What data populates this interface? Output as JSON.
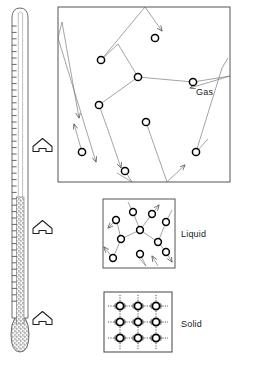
{
  "figure": {
    "background_color": "#ffffff",
    "line_color": "#3a3a3a",
    "particle_outline_color": "#000000",
    "label_color": "#1a1a1a"
  },
  "thermometer": {
    "name": "thermometer",
    "tube": {
      "x": 12,
      "y": 8,
      "width": 16,
      "height": 345
    },
    "stem_top_y": 10,
    "bulb": {
      "cx": 20,
      "cy": 340,
      "rx": 9,
      "ry": 16
    },
    "fill_top_y": 197,
    "fill_color": "#8c8c8c",
    "fill_texture": "stipple",
    "tick_count": 46,
    "tick_spacing": 6.4,
    "tick_side": "left",
    "outline_color": "#4a4a4a"
  },
  "heat_arrows": [
    {
      "name": "heat-arrow-gas",
      "x": 33,
      "y": 145,
      "points_to": "gas"
    },
    {
      "name": "heat-arrow-liquid",
      "x": 33,
      "y": 227,
      "points_to": "liquid"
    },
    {
      "name": "heat-arrow-solid",
      "x": 33,
      "y": 318,
      "points_to": "solid"
    }
  ],
  "states": [
    {
      "id": "gas",
      "label": "Gas",
      "label_x": 196,
      "label_y": 95,
      "box": {
        "x": 58,
        "y": 7,
        "width": 172,
        "height": 175
      },
      "description": "Widely separated particles travelling long straight paths, colliding with walls and each other",
      "particle_radius": 3.6,
      "particles": [
        {
          "cx": 155,
          "cy": 38
        },
        {
          "cx": 101,
          "cy": 60
        },
        {
          "cx": 138,
          "cy": 77
        },
        {
          "cx": 193,
          "cy": 82
        },
        {
          "cx": 99,
          "cy": 105
        },
        {
          "cx": 146,
          "cy": 122
        },
        {
          "cx": 82,
          "cy": 152
        },
        {
          "cx": 125,
          "cy": 171
        },
        {
          "cx": 196,
          "cy": 152
        }
      ]
    },
    {
      "id": "liquid",
      "label": "Liquid",
      "label_x": 181,
      "label_y": 237,
      "box": {
        "x": 103,
        "y": 199,
        "width": 72,
        "height": 69
      },
      "description": "Particles close together but free to slide past one another on short irregular paths",
      "particle_radius": 3.4,
      "particles": [
        {
          "cx": 116,
          "cy": 220
        },
        {
          "cx": 133,
          "cy": 212
        },
        {
          "cx": 152,
          "cy": 214
        },
        {
          "cx": 166,
          "cy": 222
        },
        {
          "cx": 140,
          "cy": 230
        },
        {
          "cx": 121,
          "cy": 239
        },
        {
          "cx": 158,
          "cy": 242
        },
        {
          "cx": 113,
          "cy": 258
        },
        {
          "cx": 140,
          "cy": 254
        },
        {
          "cx": 166,
          "cy": 252
        }
      ]
    },
    {
      "id": "solid",
      "label": "Solid",
      "label_x": 181,
      "label_y": 327,
      "box": {
        "x": 104,
        "y": 292,
        "width": 68,
        "height": 60
      },
      "description": "Particles locked in a regular lattice, vibrating about fixed positions",
      "particle_radius": 3.6,
      "lattice_columns": 3,
      "lattice_rows": 3,
      "lattice_x": [
        120,
        138,
        156
      ],
      "lattice_y": [
        306,
        322,
        338
      ]
    }
  ]
}
